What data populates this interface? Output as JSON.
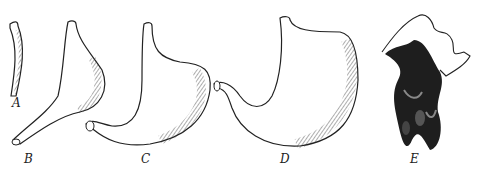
{
  "figure": {
    "panels": [
      {
        "label": "A",
        "description": "narrow tubular stomach"
      },
      {
        "label": "B",
        "description": "pear-shaped stomach with long pyloric tube"
      },
      {
        "label": "C",
        "description": "J-shaped stomach"
      },
      {
        "label": "D",
        "description": "large curved stomach"
      },
      {
        "label": "E",
        "description": "complex multi-lobed stomach (cast)"
      }
    ]
  },
  "colors": {
    "ink": "#1a1a1a",
    "background": "#ffffff"
  }
}
